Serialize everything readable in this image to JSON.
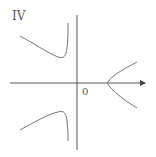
{
  "diagram": {
    "panel_label": "IV",
    "origin_label": "0",
    "colors": {
      "axis": "#555555",
      "curve": "#777777",
      "background": "#ffffff"
    },
    "axes": {
      "x_axis": {
        "y": 83,
        "x_start": 10,
        "x_end": 146,
        "arrow": true
      },
      "y_axis": {
        "x": 77,
        "y_start": 15,
        "y_end": 150,
        "arrow": false
      }
    },
    "curves": [
      {
        "name": "upper-left-branch",
        "description": "decreasing then sharply rising toward vertical asymptote left of y-axis"
      },
      {
        "name": "lower-left-branch",
        "description": "increasing then sharply falling toward vertical asymptote left of y-axis"
      },
      {
        "name": "right-branch",
        "description": "sideways parabola-like branch opening right, vertex on positive x-axis"
      }
    ]
  }
}
